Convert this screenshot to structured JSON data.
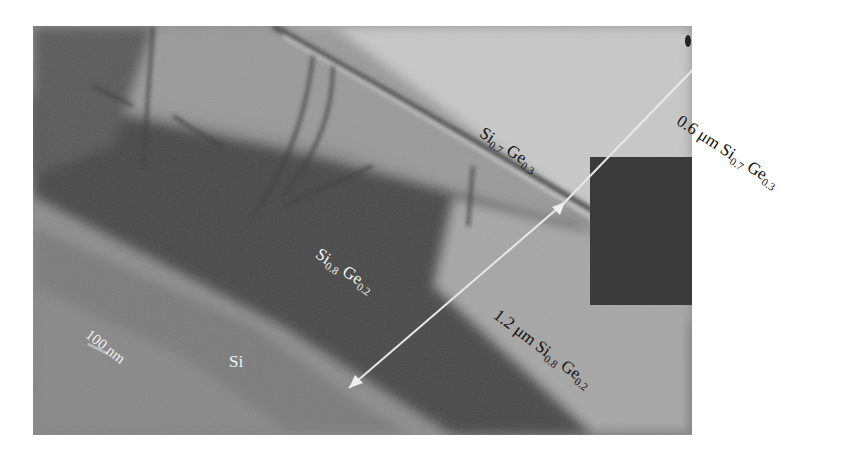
{
  "figure": {
    "type": "TEM cross-section micrograph",
    "background_color": "#ffffff",
    "overlay_box_color": "#3a3a3a",
    "arrow_color": "#e8e8e8",
    "labels": {
      "top_layer": {
        "base1": "Si",
        "sub1": "0.7",
        "base2": " Ge",
        "sub2": "0.3"
      },
      "top_thickness": {
        "prefix": "0.6 μm Si",
        "sub1": "0.7",
        "base2": " Ge",
        "sub2": "0.3"
      },
      "middle_layer": {
        "base1": "Si",
        "sub1": "0.8",
        "base2": " Ge",
        "sub2": "0.2"
      },
      "middle_thickness": {
        "prefix": "1.2 μm Si",
        "sub1": "0.8",
        "base2": " Ge",
        "sub2": "0.2"
      },
      "substrate": "Si",
      "scale_bar": "100 nm"
    }
  }
}
